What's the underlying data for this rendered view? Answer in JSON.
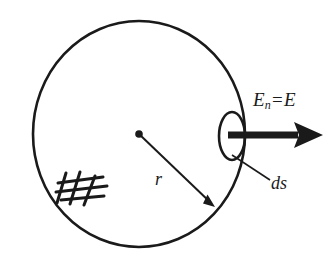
{
  "figure": {
    "background_color": "#ffffff",
    "ink_color": "#1a1a1a"
  },
  "labels": {
    "field": {
      "symbol": "E",
      "subscript": "n",
      "operator": "=",
      "value": "E",
      "full_text": "E_n = E"
    },
    "area_element": "ds",
    "radius": "r"
  },
  "shapes": {
    "sphere": {
      "name": "gaussian-sphere",
      "center_x": 139,
      "center_y": 134,
      "radius_x": 106,
      "radius_y": 113,
      "stroke_width": 2.6
    },
    "center_point": {
      "name": "sphere-center",
      "x": 139,
      "y": 134,
      "radius": 3.8
    },
    "radius_arrow": {
      "name": "radius-arrow",
      "from_x": 139,
      "from_y": 134,
      "to_x": 215,
      "to_y": 207,
      "stroke_width": 2.0
    },
    "area_patch": {
      "name": "area-element-ellipse",
      "center_x": 232,
      "center_y": 136,
      "radius_x": 13,
      "radius_y": 24,
      "stroke_width": 2.6
    },
    "field_arrow": {
      "name": "field-vector-arrow",
      "from_x": 228,
      "from_y": 135,
      "to_x": 323,
      "to_y": 135,
      "shaft_thickness": 7,
      "head_length": 26,
      "head_half_width": 13
    },
    "leader_line": {
      "name": "ds-leader-line",
      "from_x": 232,
      "from_y": 155,
      "to_x": 270,
      "to_y": 180,
      "stroke_width": 1.6
    },
    "hatching": {
      "name": "surface-hatching",
      "stroke_width": 3.0,
      "strokes": [
        [
          58,
          183,
          103,
          177
        ],
        [
          56,
          192,
          107,
          186
        ],
        [
          61,
          200,
          104,
          196
        ],
        [
          66,
          173,
          57,
          203
        ],
        [
          80,
          172,
          70,
          204
        ],
        [
          95,
          176,
          84,
          205
        ]
      ]
    }
  }
}
